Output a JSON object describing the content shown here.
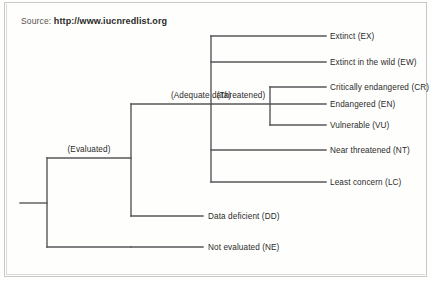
{
  "source": {
    "prefix": "Source:",
    "url": "http://www.iucnredlist.org"
  },
  "colors": {
    "line": "#58565a",
    "text": "#2b2b2b",
    "background": "#fefefc",
    "border": "#c8c8c8",
    "source_text": "#55524f"
  },
  "diagram": {
    "type": "horizontal-dendrogram",
    "groups": [
      {
        "id": "evaluated",
        "label": "(Evaluated)"
      },
      {
        "id": "adequate-data",
        "label": "(Adequate data)"
      },
      {
        "id": "threatened",
        "label": "(Threatened)"
      }
    ],
    "leaves": [
      {
        "id": "extinct",
        "label": "Extinct (EX)",
        "code": "EX"
      },
      {
        "id": "extinct-in-the-wild",
        "label": "Extinct in the wild (EW)",
        "code": "EW"
      },
      {
        "id": "critically-endangered",
        "label": "Critically endangered (CR)",
        "code": "CR"
      },
      {
        "id": "endangered",
        "label": "Endangered (EN)",
        "code": "EN"
      },
      {
        "id": "vulnerable",
        "label": "Vulnerable (VU)",
        "code": "VU"
      },
      {
        "id": "near-threatened",
        "label": "Near threatened (NT)",
        "code": "NT"
      },
      {
        "id": "least-concern",
        "label": "Least concern (LC)",
        "code": "LC"
      },
      {
        "id": "data-deficient",
        "label": "Data deficient (DD)",
        "code": "DD"
      },
      {
        "id": "not-evaluated",
        "label": "Not evaluated (NE)",
        "code": "NE"
      }
    ]
  }
}
